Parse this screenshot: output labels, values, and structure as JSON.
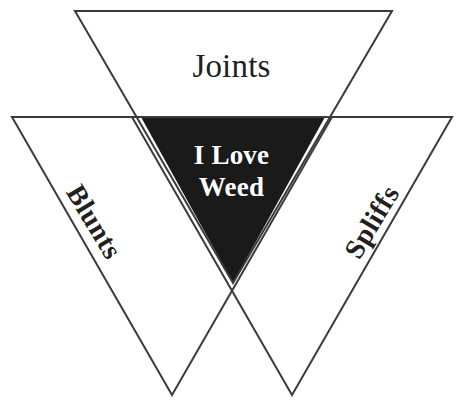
{
  "diagram": {
    "type": "venn-triangles",
    "background_color": "#ffffff",
    "outline_color": "#3b3b3b",
    "core_fill_color": "#1a1a1a",
    "core_text_color": "#ffffff",
    "outer_text_color": "#231f20",
    "regions": [
      {
        "id": "top",
        "label": "Joints",
        "shape": "inverted-triangle",
        "points": "75,11 392,11 233,283",
        "filled": false
      },
      {
        "id": "left",
        "label": "Blunts",
        "shape": "inverted-triangle",
        "points": "12,117 332,117 172,395",
        "filled": false,
        "rotation_deg": 59
      },
      {
        "id": "right",
        "label": "Spliffs",
        "shape": "inverted-triangle",
        "points": "132,117 452,117 292,395",
        "filled": false,
        "rotation_deg": -59
      },
      {
        "id": "center",
        "label_line1": "I Love",
        "label_line2": "Weed",
        "shape": "inverted-triangle",
        "points": "141,117 325,117 233,283",
        "filled": true
      }
    ]
  }
}
